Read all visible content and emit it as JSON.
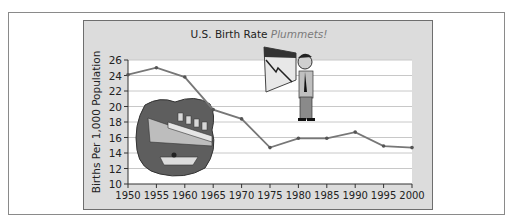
{
  "chart_data": {
    "type": "line",
    "title": "U.S. Birth Rate",
    "title_emphasis": "Plummets!",
    "xlabel": "",
    "ylabel": "Births Per 1,000 Population",
    "x": [
      "1950",
      "1955",
      "1960",
      "1965",
      "1970",
      "1975",
      "1980",
      "1985",
      "1990",
      "1995",
      "2000"
    ],
    "series": [
      {
        "name": "Birth rate",
        "values": [
          24.1,
          25.0,
          23.8,
          19.6,
          18.4,
          14.7,
          15.9,
          15.9,
          16.7,
          14.9,
          14.7
        ]
      }
    ],
    "yticks": [
      "10",
      "12",
      "14",
      "16",
      "18",
      "20",
      "22",
      "24",
      "26"
    ],
    "ylim": [
      10,
      26
    ],
    "grid": true,
    "legend": "none",
    "annotations": [
      "sinking-ship-illustration",
      "man-looking-at-falling-chart-illustration"
    ],
    "colors": {
      "line": "#777777",
      "panel": "#dcdcdc",
      "plot": "#ffffff",
      "grid": "#c8c8c8"
    }
  }
}
